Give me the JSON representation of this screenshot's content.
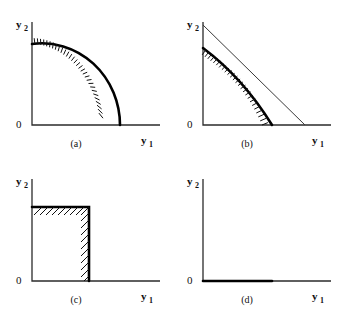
{
  "figure": {
    "background_color": "#ffffff",
    "ink_color": "#000000",
    "panel_count": 4
  },
  "labels": {
    "y_axis_symbol": "y",
    "y_axis_subscript": "2",
    "x_axis_symbol": "y",
    "x_axis_subscript": "1",
    "origin": "0"
  },
  "panels": [
    {
      "id": "a",
      "caption": "(a)",
      "x_axis_label": "y",
      "x_axis_subscript": "1",
      "y_axis_label": "y",
      "y_axis_subscript": "2",
      "origin_label": "0",
      "frontier_type": "concave-arc",
      "frontier_description": "smooth concave arc from the y2 intercept to the y1 intercept",
      "hatching": "inward ticks along the arc",
      "hatch_count": 30,
      "geometry": {
        "origin_x": 32,
        "origin_y": 125,
        "x_axis_end": 160,
        "y_axis_top": 22,
        "y_intercept": 44,
        "x_intercept": 120
      }
    },
    {
      "id": "b",
      "caption": "(b)",
      "x_axis_label": "y",
      "x_axis_subscript": "1",
      "y_axis_label": "y",
      "y_axis_subscript": "2",
      "origin_label": "0",
      "frontier_type": "concave-arc-with-tangent-line",
      "frontier_description": "thick concave frontier with a thin straight isoprofit line tangent to it",
      "hatching": "inward ticks along the thick frontier",
      "hatch_count": 26,
      "geometry": {
        "origin_x": 32,
        "origin_y": 125,
        "x_axis_end": 160,
        "y_axis_top": 22,
        "curve_y_intercept": 48,
        "curve_x_intercept": 101,
        "line_y_intercept": 25,
        "line_x_intercept": 134,
        "tangency_x": 73,
        "tangency_y": 85
      }
    },
    {
      "id": "c",
      "caption": "(c)",
      "x_axis_label": "y",
      "x_axis_subscript": "1",
      "y_axis_label": "y",
      "y_axis_subscript": "2",
      "origin_label": "0",
      "frontier_type": "rectangle",
      "frontier_description": "rectangular feasible set with hatching inside the top and right edges",
      "hatching": "diagonal hatch strokes inside the top and right edges",
      "hatch_count": 22,
      "geometry": {
        "origin_x": 32,
        "origin_y": 124,
        "x_axis_end": 160,
        "y_axis_top": 22,
        "rect_top": 50,
        "rect_right": 89
      }
    },
    {
      "id": "d",
      "caption": "(d)",
      "x_axis_label": "y",
      "x_axis_subscript": "1",
      "y_axis_label": "y",
      "y_axis_subscript": "2",
      "origin_label": "0",
      "frontier_type": "segment-on-x-axis",
      "frontier_description": "degenerate feasible set: a thick segment lying along the y1 axis",
      "hatching": "none",
      "hatch_count": 0,
      "geometry": {
        "origin_x": 32,
        "origin_y": 124,
        "x_axis_end": 160,
        "y_axis_top": 22,
        "segment_end": 101
      }
    }
  ]
}
